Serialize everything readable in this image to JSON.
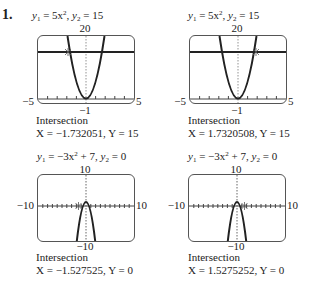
{
  "problem_number": "1.",
  "panels": [
    {
      "eq_y1": "5x",
      "eq_y1_exp": "2",
      "eq_y2": "15",
      "window": {
        "xmin": "−5",
        "xmax": "5",
        "ymin": "−1",
        "ymax": "20"
      },
      "caption_title": "Intersection",
      "caption_result": "X = −1.732051,  Y = 15"
    },
    {
      "eq_y1": "5x",
      "eq_y1_exp": "2",
      "eq_y2": "15",
      "window": {
        "xmin": "−5",
        "xmax": "5",
        "ymin": "−1",
        "ymax": "20"
      },
      "caption_title": "Intersection",
      "caption_result": "X = 1.7320508,  Y = 15"
    },
    {
      "eq_y1": "−3x",
      "eq_y1_exp": "2",
      "eq_y1_tail": " + 7",
      "eq_y2": "0",
      "window": {
        "xmin": "−10",
        "xmax": "10",
        "ymin": "−10",
        "ymax": "10"
      },
      "caption_title": "Intersection",
      "caption_result": "X = −1.527525,  Y = 0"
    },
    {
      "eq_y1": "−3x",
      "eq_y1_exp": "2",
      "eq_y1_tail": " + 7",
      "eq_y2": "0",
      "window": {
        "xmin": "−10",
        "xmax": "10",
        "ymin": "−10",
        "ymax": "10"
      },
      "caption_title": "Intersection",
      "caption_result": "X = 1.5275252,  Y = 0"
    }
  ]
}
